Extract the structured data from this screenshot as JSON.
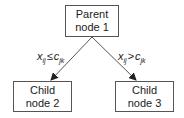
{
  "diagram": {
    "type": "decision-tree-split",
    "nodes": [
      {
        "id": "n1",
        "line1": "Parent",
        "line2": "node 1",
        "role": "parent"
      },
      {
        "id": "n2",
        "line1": "Child",
        "line2": "node 2",
        "role": "child"
      },
      {
        "id": "n3",
        "line1": "Child",
        "line2": "node 3",
        "role": "child"
      }
    ],
    "edges": [
      {
        "from": "n1",
        "to": "n2",
        "label": {
          "var": "x",
          "var_sub": "ij",
          "op": "≤",
          "thr": "c",
          "thr_sub": "jk"
        }
      },
      {
        "from": "n1",
        "to": "n3",
        "label": {
          "var": "x",
          "var_sub": "ij",
          "op": ">",
          "thr": "c",
          "thr_sub": "jk"
        }
      }
    ],
    "colors": {
      "line": "#555555",
      "text": "#1a1a1a",
      "background": "#ffffff"
    }
  }
}
